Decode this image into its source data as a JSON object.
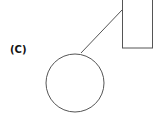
{
  "diagram": {
    "label": "(C)",
    "stroke_color": "#555555",
    "circle": {
      "cx": 75,
      "cy": 83,
      "r": 29
    },
    "rectangle": {
      "x": 122,
      "y": -2,
      "width": 30,
      "height": 50
    },
    "connector": {
      "x1": 122,
      "y1": 10,
      "x2": 81,
      "y2": 53
    }
  }
}
